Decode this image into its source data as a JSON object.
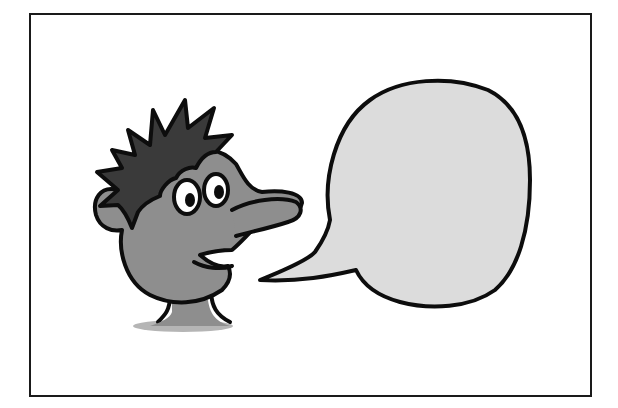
{
  "illustration": {
    "title": "Cartoon character with empty speech bubble",
    "character": {
      "description": "spiky-haired cartoon man with big eyes and a long nose, smiling",
      "hair_color": "#3a3a3a",
      "skin_color": "#8e8e8e",
      "eye_white": "#ffffff",
      "outline_color": "#0d0d0d"
    },
    "speech_bubble": {
      "text": "",
      "fill_color": "#dcdcdc",
      "outline_color": "#0d0d0d"
    },
    "frame": {
      "border_color": "#1a1a1a",
      "background": "#ffffff"
    }
  }
}
